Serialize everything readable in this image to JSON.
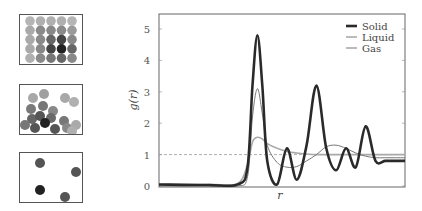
{
  "panels": {
    "solid": {
      "label": "Solid lattice illustration"
    },
    "liquid": {
      "label": "Liquid illustration"
    },
    "gas": {
      "label": "Gas illustration"
    }
  },
  "chart_data": {
    "type": "line",
    "title": "",
    "xlabel": "r",
    "ylabel": "g(r)",
    "ylim": [
      0,
      5.5
    ],
    "yticks": [
      0,
      1,
      2,
      3,
      4,
      5
    ],
    "xticks": [],
    "grid": false,
    "reference_line": {
      "y": 1,
      "style": "dashed"
    },
    "legend": {
      "position": "upper right",
      "entries": [
        "Solid",
        "Liquid",
        "Gas"
      ]
    },
    "x": [
      0.0,
      0.5,
      0.8,
      0.9,
      0.95,
      1.0,
      1.05,
      1.1,
      1.2,
      1.3,
      1.4,
      1.5,
      1.6,
      1.7,
      1.8,
      1.9,
      2.0,
      2.1,
      2.2,
      2.3,
      2.4,
      2.5
    ],
    "series": [
      {
        "name": "Solid",
        "color": "#2a2a2a",
        "width": "thick",
        "values": [
          0.05,
          0.03,
          0.05,
          0.6,
          3.2,
          4.8,
          3.2,
          0.8,
          0.05,
          1.2,
          0.2,
          1.3,
          3.2,
          1.2,
          0.5,
          1.2,
          0.6,
          1.9,
          0.8,
          0.8,
          0.8,
          0.8
        ]
      },
      {
        "name": "Liquid",
        "color": "#777777",
        "width": "thin",
        "values": [
          0.0,
          0.0,
          0.0,
          0.3,
          2.2,
          3.1,
          2.3,
          1.3,
          0.75,
          0.6,
          0.62,
          0.8,
          1.0,
          1.25,
          1.3,
          1.2,
          1.05,
          0.95,
          0.9,
          0.9,
          0.9,
          0.9
        ]
      },
      {
        "name": "Gas",
        "color": "#aaaaaa",
        "width": "medium",
        "values": [
          0.05,
          0.05,
          0.08,
          0.7,
          1.4,
          1.55,
          1.5,
          1.35,
          1.2,
          1.1,
          1.05,
          1.02,
          1.0,
          1.0,
          1.0,
          1.0,
          1.0,
          1.0,
          1.0,
          1.0,
          1.0,
          1.0
        ]
      }
    ]
  }
}
